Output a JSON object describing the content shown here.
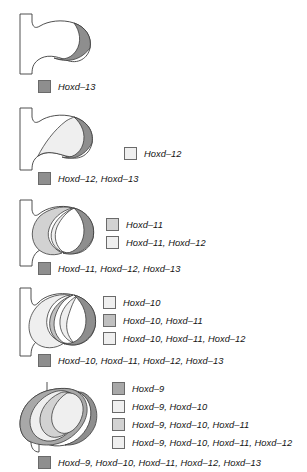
{
  "figure": {
    "background_color": "#ffffff",
    "outline_color": "#3c3c3c"
  },
  "palette": {
    "white": "#ffffff",
    "very_light_gray": "#efefef",
    "light_gray": "#e2e2e2",
    "mid_light_gray": "#d2d2d2",
    "mid_gray": "#c0c0c0",
    "gray": "#b0b0b0",
    "dark_gray": "#8e8e8e",
    "swatch_border": "#6a6a6a",
    "text": "#141414"
  },
  "panels": [
    {
      "id": "panel-1",
      "index": 1,
      "legend": [
        {
          "label": "Hoxd–13",
          "color": "#8e8e8e",
          "position": "bottom"
        }
      ]
    },
    {
      "id": "panel-2",
      "index": 2,
      "legend": [
        {
          "label": "Hoxd–12",
          "color": "#efefef",
          "position": "right"
        },
        {
          "label": "Hoxd–12, Hoxd–13",
          "color": "#8e8e8e",
          "position": "bottom"
        }
      ]
    },
    {
      "id": "panel-3",
      "index": 3,
      "legend": [
        {
          "label": "Hoxd–11",
          "color": "#d2d2d2",
          "position": "right"
        },
        {
          "label": "Hoxd–11, Hoxd–12",
          "color": "#efefef",
          "position": "right"
        },
        {
          "label": "Hoxd–11, Hoxd–12, Hoxd–13",
          "color": "#8e8e8e",
          "position": "bottom"
        }
      ]
    },
    {
      "id": "panel-4",
      "index": 4,
      "legend": [
        {
          "label": "Hoxd–10",
          "color": "#efefef",
          "position": "right"
        },
        {
          "label": "Hoxd–10, Hoxd–11",
          "color": "#c0c0c0",
          "position": "right"
        },
        {
          "label": "Hoxd–10, Hoxd–11, Hoxd–12",
          "color": "#efefef",
          "position": "right"
        },
        {
          "label": "Hoxd–10, Hoxd–11, Hoxd–12, Hoxd–13",
          "color": "#8e8e8e",
          "position": "bottom"
        }
      ]
    },
    {
      "id": "panel-5",
      "index": 5,
      "legend": [
        {
          "label": "Hoxd–9",
          "color": "#a8a8a8",
          "position": "right"
        },
        {
          "label": "Hoxd–9, Hoxd–10",
          "color": "#efefef",
          "position": "right"
        },
        {
          "label": "Hoxd–9, Hoxd–10, Hoxd–11",
          "color": "#d2d2d2",
          "position": "right"
        },
        {
          "label": "Hoxd–9, Hoxd–10, Hoxd–11, Hoxd–12",
          "color": "#efefef",
          "position": "right"
        },
        {
          "label": "Hoxd–9, Hoxd–10, Hoxd–11, Hoxd–12, Hoxd–13",
          "color": "#8e8e8e",
          "position": "bottom"
        }
      ]
    }
  ]
}
